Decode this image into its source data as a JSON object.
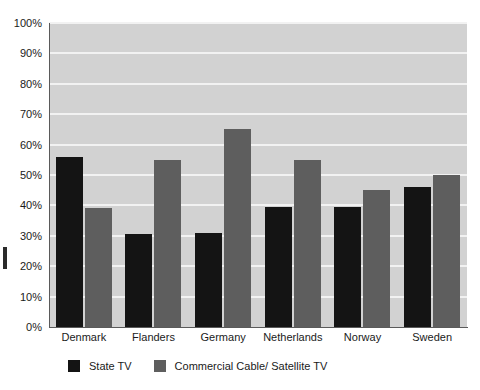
{
  "chart_data": {
    "type": "bar",
    "title": "",
    "subtitle": "",
    "xlabel": "",
    "ylabel": "",
    "ylim": [
      0,
      100
    ],
    "grid": true,
    "legend_position": "bottom-left",
    "categories": [
      "Denmark",
      "Flanders",
      "Germany",
      "Netherlands",
      "Norway",
      "Sweden"
    ],
    "ytick_labels": [
      "0%",
      "10%",
      "20%",
      "30%",
      "40%",
      "50%",
      "60%",
      "70%",
      "80%",
      "90%",
      "100%"
    ],
    "ytick_values": [
      0,
      10,
      20,
      30,
      40,
      50,
      60,
      70,
      80,
      90,
      100
    ],
    "series": [
      {
        "name": "State TV",
        "color": "#141414",
        "values": [
          56,
          30.5,
          31,
          39.5,
          39.5,
          46
        ]
      },
      {
        "name": "Commercial Cable/ Satellite TV",
        "color": "#5e5e5e",
        "values": [
          39,
          55,
          65,
          55,
          45,
          50
        ]
      }
    ]
  },
  "legend": {
    "items": [
      {
        "label": "State TV",
        "color": "#141414"
      },
      {
        "label": "Commercial Cable/ Satellite TV",
        "color": "#5e5e5e"
      }
    ]
  },
  "colors": {
    "plot_background": "#d2d2d2",
    "gridline": "#f2f2f2",
    "axis": "#5a5a5a",
    "state_tv": "#141414",
    "commercial_tv": "#5e5e5e"
  }
}
